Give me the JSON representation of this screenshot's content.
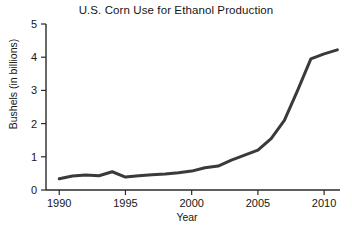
{
  "chart_data": {
    "type": "line",
    "title": "U.S. Corn Use for Ethanol Production",
    "xlabel": "Year",
    "ylabel": "Bushels (in billions)",
    "xlim": [
      1989.0,
      2011.2
    ],
    "ylim": [
      0,
      5
    ],
    "grid": false,
    "legend": null,
    "x_ticks": [
      1990,
      1995,
      2000,
      2005,
      2010
    ],
    "x_tick_labels": [
      "1990",
      "1995",
      "2000",
      "2005",
      "2010"
    ],
    "y_ticks": [
      0,
      1,
      2,
      3,
      4,
      5
    ],
    "y_tick_labels": [
      "0",
      "1",
      "2",
      "3",
      "4",
      "5"
    ],
    "series": [
      {
        "name": "U.S. corn used for ethanol",
        "color": "#3a3a3a",
        "line_width": 3,
        "x": [
          1990,
          1991,
          1992,
          1993,
          1994,
          1995,
          1996,
          1997,
          1998,
          1999,
          2000,
          2001,
          2002,
          2003,
          2004,
          2005,
          2006,
          2007,
          2008,
          2009,
          2010,
          2011
        ],
        "values": [
          0.34,
          0.42,
          0.45,
          0.43,
          0.55,
          0.39,
          0.43,
          0.46,
          0.48,
          0.52,
          0.57,
          0.67,
          0.72,
          0.9,
          1.05,
          1.2,
          1.55,
          2.1,
          3.0,
          3.95,
          4.1,
          4.22
        ]
      }
    ]
  },
  "axes": {
    "y_axis_name": "bushels-axis",
    "x_axis_name": "year-axis"
  }
}
